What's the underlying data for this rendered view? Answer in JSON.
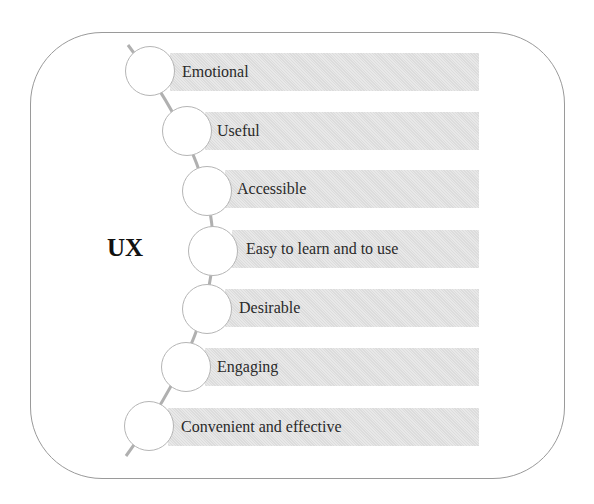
{
  "diagram": {
    "center_label": "UX",
    "items": [
      {
        "label": "Emotional"
      },
      {
        "label": "Useful"
      },
      {
        "label": "Accessible"
      },
      {
        "label": "Easy to learn and to use"
      },
      {
        "label": "Desirable"
      },
      {
        "label": "Engaging"
      },
      {
        "label": "Convenient and effective"
      }
    ],
    "colors": {
      "bar_fill": "#e3e3e3",
      "circle_fill": "#ffffff",
      "circle_stroke": "#b5b5b5",
      "frame_stroke": "#9a9a9a",
      "text": "#2a2a2a"
    }
  }
}
